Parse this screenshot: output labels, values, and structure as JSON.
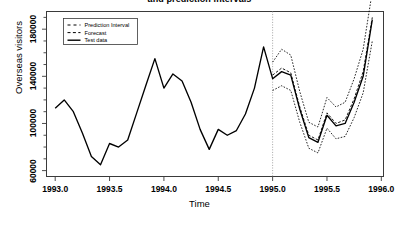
{
  "chart_data": {
    "type": "line",
    "title": "and prediction intervals",
    "xlabel": "Time",
    "ylabel": "Overseas visitors",
    "xlim": [
      1992.92,
      1996.02
    ],
    "ylim": [
      55000,
      195000
    ],
    "xticks": [
      "1993.0",
      "1993.5",
      "1994.0",
      "1994.5",
      "1995.0",
      "1995.5",
      "1996.0"
    ],
    "xtick_values": [
      1993.0,
      1993.5,
      1994.0,
      1994.5,
      1995.0,
      1995.5,
      1996.0
    ],
    "yticks": [
      "60000",
      "100000",
      "140000",
      "180000"
    ],
    "ytick_values": [
      60000,
      100000,
      140000,
      180000
    ],
    "grid": false,
    "legend_position": "top-left",
    "forecast_start": 1995.0,
    "series": [
      {
        "name": "Test data",
        "style": "solid",
        "x": [
          1993.0,
          1993.083,
          1993.167,
          1993.25,
          1993.333,
          1993.417,
          1993.5,
          1993.583,
          1993.667,
          1993.75,
          1993.833,
          1993.917,
          1994.0,
          1994.083,
          1994.167,
          1994.25,
          1994.333,
          1994.417,
          1994.5,
          1994.583,
          1994.667,
          1994.75,
          1994.833,
          1994.917,
          1995.0,
          1995.083,
          1995.167,
          1995.25,
          1995.333,
          1995.417,
          1995.5,
          1995.583,
          1995.667,
          1995.75,
          1995.833,
          1995.917
        ],
        "y": [
          113000,
          120000,
          110000,
          92000,
          72000,
          65000,
          83000,
          80000,
          86000,
          109000,
          132000,
          155000,
          130000,
          142000,
          136000,
          118000,
          95000,
          78000,
          95000,
          90000,
          94000,
          108000,
          130000,
          165000,
          138000,
          144000,
          141000,
          112000,
          88000,
          84000,
          107000,
          98000,
          100000,
          118000,
          140000,
          188000
        ]
      },
      {
        "name": "Forecast",
        "style": "dashed",
        "x": [
          1995.0,
          1995.083,
          1995.167,
          1995.25,
          1995.333,
          1995.417,
          1995.5,
          1995.583,
          1995.667,
          1995.75,
          1995.833,
          1995.917
        ],
        "y": [
          141000,
          147000,
          143000,
          114000,
          90000,
          86000,
          109000,
          100000,
          103000,
          121000,
          144000,
          190000
        ]
      },
      {
        "name": "Prediction Interval",
        "style": "dashed",
        "bound": "upper",
        "x": [
          1995.0,
          1995.083,
          1995.167,
          1995.25,
          1995.333,
          1995.417,
          1995.5,
          1995.583,
          1995.667,
          1995.75,
          1995.833,
          1995.917
        ],
        "y": [
          152000,
          163000,
          158000,
          127000,
          101000,
          97000,
          122000,
          114000,
          118000,
          138000,
          163000,
          212000
        ]
      },
      {
        "name": "Prediction Interval",
        "style": "dashed",
        "bound": "lower",
        "x": [
          1995.0,
          1995.083,
          1995.167,
          1995.25,
          1995.333,
          1995.417,
          1995.5,
          1995.583,
          1995.667,
          1995.75,
          1995.833,
          1995.917
        ],
        "y": [
          128000,
          132000,
          128000,
          101000,
          79000,
          75000,
          96000,
          87000,
          89000,
          105000,
          126000,
          170000
        ]
      }
    ],
    "legend": [
      {
        "label": "Prediction Interval",
        "style": "dashed-sparse"
      },
      {
        "label": "Forecast",
        "style": "dashed"
      },
      {
        "label": "Test data",
        "style": "solid"
      }
    ],
    "colors": {
      "line": "#000000",
      "axis": "#3a3a3a",
      "divider": "#9a9a9a",
      "background": "#ffffff"
    }
  }
}
